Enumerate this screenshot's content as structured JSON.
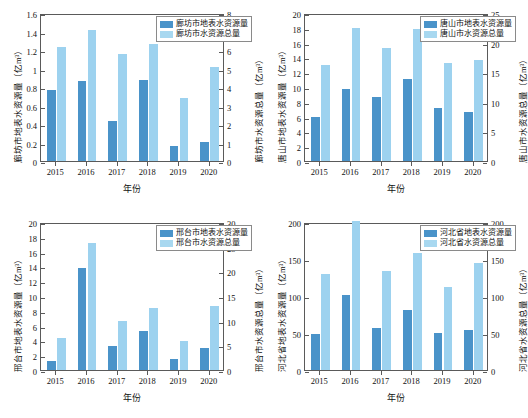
{
  "figure": {
    "caption_fragment": "",
    "colors": {
      "series1": "#4a93c9",
      "series2": "#9dd2ef",
      "axis": "#5a5a5a"
    }
  },
  "chart_data": [
    {
      "id": "langfang",
      "type": "bar",
      "title": "",
      "xlabel": "年份",
      "ylabel": "廊坊市地表水资源量（亿m³）",
      "y2label": "廊坊市水资源总量（亿m³）",
      "categories": [
        "2015",
        "2016",
        "2017",
        "2018",
        "2019",
        "2020"
      ],
      "ylim": [
        0,
        1.6
      ],
      "yticks": [
        0,
        0.2,
        0.4,
        0.6,
        0.8,
        1,
        1.2,
        1.4,
        1.6
      ],
      "ytick_labels": [
        "0",
        "0.2",
        "0.4",
        "0.6",
        "0.8",
        "1",
        "1.2",
        "1.4",
        "1.6"
      ],
      "y2lim": [
        0,
        8
      ],
      "y2ticks": [
        0,
        1,
        2,
        3,
        4,
        5,
        6,
        7,
        8
      ],
      "y2tick_labels": [
        "0",
        "1",
        "2",
        "3",
        "4",
        "5",
        "6",
        "7",
        "8"
      ],
      "grid": false,
      "legend_position": "top-right",
      "series": [
        {
          "name": "廊坊市地表水资源量",
          "axis": "left",
          "values": [
            0.77,
            0.87,
            0.43,
            0.88,
            0.16,
            0.21
          ]
        },
        {
          "name": "廊坊市水资源总量",
          "axis": "right",
          "values": [
            6.15,
            7.1,
            5.8,
            6.3,
            3.4,
            5.1
          ]
        }
      ]
    },
    {
      "id": "tangshan",
      "type": "bar",
      "title": "",
      "xlabel": "年份",
      "ylabel": "唐山市地表水资源量（亿m³）",
      "y2label": "唐山市水资源总量（亿m³）",
      "categories": [
        "2015",
        "2016",
        "2017",
        "2018",
        "2019",
        "2020"
      ],
      "ylim": [
        0,
        20
      ],
      "yticks": [
        0,
        2,
        4,
        6,
        8,
        10,
        12,
        14,
        16,
        18,
        20
      ],
      "ytick_labels": [
        "0",
        "2",
        "4",
        "6",
        "8",
        "10",
        "12",
        "14",
        "16",
        "18",
        "20"
      ],
      "y2lim": [
        0,
        25
      ],
      "y2ticks": [
        0,
        5,
        10,
        15,
        20,
        25
      ],
      "y2tick_labels": [
        "0",
        "5",
        "10",
        "15",
        "20",
        "25"
      ],
      "grid": false,
      "legend_position": "top-right",
      "series": [
        {
          "name": "唐山市地表水资源量",
          "axis": "left",
          "values": [
            6.0,
            9.7,
            8.7,
            11.1,
            7.2,
            6.6
          ]
        },
        {
          "name": "唐山市水资源总量",
          "axis": "right",
          "values": [
            16.3,
            22.4,
            19.1,
            22.3,
            16.5,
            17.0
          ]
        }
      ]
    },
    {
      "id": "xingtai",
      "type": "bar",
      "title": "",
      "xlabel": "年份",
      "ylabel": "邢台市地表水资源量（亿m³）",
      "y2label": "邢台市水资源总量（亿m³）",
      "categories": [
        "2015",
        "2016",
        "2017",
        "2018",
        "2019",
        "2020"
      ],
      "ylim": [
        0,
        20
      ],
      "yticks": [
        0,
        2,
        4,
        6,
        8,
        10,
        12,
        14,
        16,
        18,
        20
      ],
      "ytick_labels": [
        "0",
        "2",
        "4",
        "6",
        "8",
        "10",
        "12",
        "14",
        "16",
        "18",
        "20"
      ],
      "y2lim": [
        0,
        30
      ],
      "y2ticks": [
        0,
        5,
        10,
        15,
        20,
        25,
        30
      ],
      "y2tick_labels": [
        "0",
        "5",
        "10",
        "15",
        "20",
        "25",
        "30"
      ],
      "grid": false,
      "legend_position": "top-right",
      "series": [
        {
          "name": "邢台市地表水资源量",
          "axis": "left",
          "values": [
            1.2,
            13.8,
            3.3,
            5.3,
            1.5,
            3.0
          ]
        },
        {
          "name": "邢台市水资源总量",
          "axis": "right",
          "values": [
            6.5,
            25.7,
            10.0,
            12.5,
            5.9,
            13.0
          ]
        }
      ]
    },
    {
      "id": "hebei",
      "type": "bar",
      "title": "",
      "xlabel": "年份",
      "ylabel": "河北省地表水资源量（亿m³）",
      "y2label": "河北省水资源总量（亿m³）",
      "categories": [
        "2015",
        "2016",
        "2017",
        "2018",
        "2019",
        "2020"
      ],
      "ylim": [
        0,
        200
      ],
      "yticks": [
        0,
        50,
        100,
        150,
        200
      ],
      "ytick_labels": [
        "0",
        "50",
        "100",
        "150",
        "200"
      ],
      "y2lim": [
        0,
        200
      ],
      "y2ticks": [
        0,
        50,
        100,
        150,
        200
      ],
      "y2tick_labels": [
        "0",
        "50",
        "100",
        "150",
        "200"
      ],
      "grid": false,
      "legend_position": "top-right",
      "series": [
        {
          "name": "河北省地表水资源量",
          "axis": "left",
          "values": [
            49,
            102,
            57,
            81,
            50,
            54
          ]
        },
        {
          "name": "河北省水资源总量",
          "axis": "right",
          "values": [
            130,
            201,
            134,
            158,
            112,
            145
          ]
        }
      ]
    }
  ]
}
